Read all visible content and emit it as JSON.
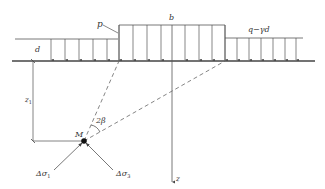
{
  "diagram": {
    "type": "soil-stress-load-diagram",
    "colors": {
      "line": "#555555",
      "ground": "#444444",
      "dashed": "#666666",
      "text": "#333333",
      "point": "#111111",
      "background": "#ffffff"
    },
    "labels": {
      "p": "p",
      "b": "b",
      "q_minus_gamma_d": "q−γd",
      "d": "d",
      "z1": "z",
      "z1_sub": "1",
      "z_axis": "z",
      "M": "M",
      "two_beta": "2β",
      "delta_sigma1": "Δσ",
      "delta_sigma1_sub": "1",
      "delta_sigma3": "Δσ",
      "delta_sigma3_sub": "3"
    },
    "loads": {
      "left_strip": {
        "label": "d",
        "arrow_count": 6
      },
      "center_strip": {
        "label": "b",
        "load": "p",
        "arrow_count": 6
      },
      "right_strip": {
        "label": "q−γd",
        "arrow_count": 6
      }
    },
    "point_M": {
      "label": "M",
      "angle": "2β"
    }
  }
}
